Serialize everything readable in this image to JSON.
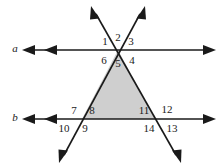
{
  "figure": {
    "width": 221,
    "height": 168,
    "background_color": "#ffffff",
    "stroke_color": "#1a1a1a",
    "shade_color": "#cfcfcf",
    "shade_stroke_color": "#1a1a1a"
  },
  "lines": [
    {
      "name": "line-a",
      "label": "a",
      "label_x": 15,
      "label_y": 48,
      "y": 50,
      "x_start": 22,
      "x_end": 215,
      "arrow_left_count": 2,
      "arrow_right_count": 1
    },
    {
      "name": "line-b",
      "label": "b",
      "label_x": 15,
      "label_y": 117,
      "y": 119,
      "x_start": 22,
      "x_end": 215,
      "arrow_left_count": 2,
      "arrow_right_count": 1
    }
  ],
  "transversals": [
    {
      "name": "transversal-left-to-right",
      "from_x": 92,
      "from_y": 10,
      "to_x": 180,
      "to_y": 160,
      "arrow_start": true,
      "arrow_end": true
    },
    {
      "name": "transversal-right-to-left",
      "from_x": 144,
      "from_y": 10,
      "to_x": 60,
      "to_y": 160,
      "arrow_start": true,
      "arrow_end": true
    }
  ],
  "intersections": [
    {
      "name": "apex-on-line-a",
      "x": 118,
      "y": 50
    },
    {
      "name": "left-vertex-on-line-b",
      "x": 82,
      "y": 119
    },
    {
      "name": "right-vertex-on-line-b",
      "x": 155,
      "y": 119
    }
  ],
  "shaded_triangle": {
    "name": "shaded-triangle",
    "points": "118,50 155,119 82,119",
    "fill": "#cfcfcf"
  },
  "angle_labels": [
    {
      "id": "1",
      "text": "1",
      "x": 105,
      "y": 41
    },
    {
      "id": "2",
      "text": "2",
      "x": 118,
      "y": 37
    },
    {
      "id": "3",
      "text": "3",
      "x": 131,
      "y": 41
    },
    {
      "id": "4",
      "text": "4",
      "x": 132,
      "y": 60
    },
    {
      "id": "5",
      "text": "5",
      "x": 118,
      "y": 63
    },
    {
      "id": "6",
      "text": "6",
      "x": 104,
      "y": 60
    },
    {
      "id": "7",
      "text": "7",
      "x": 74,
      "y": 110
    },
    {
      "id": "8",
      "text": "8",
      "x": 92,
      "y": 110
    },
    {
      "id": "9",
      "text": "9",
      "x": 85,
      "y": 128
    },
    {
      "id": "10",
      "text": "10",
      "x": 64,
      "y": 128
    },
    {
      "id": "11",
      "text": "11",
      "x": 144,
      "y": 110
    },
    {
      "id": "12",
      "text": "12",
      "x": 167,
      "y": 109
    },
    {
      "id": "13",
      "text": "13",
      "x": 172,
      "y": 128
    },
    {
      "id": "14",
      "text": "14",
      "x": 149,
      "y": 128
    }
  ]
}
